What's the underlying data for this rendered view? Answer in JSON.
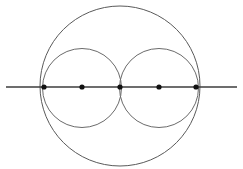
{
  "figure": {
    "canvas": {
      "width": 243,
      "height": 169,
      "background": "#ffffff"
    },
    "colors": {
      "circle_stroke": "#6b6b6b",
      "big_circle_stroke": "#5a5a5a",
      "line_stroke": "#3c3c3c",
      "point_fill": "#111111"
    },
    "stroke_widths": {
      "circle": 1,
      "line": 1.6
    },
    "shapes": {
      "big_circle": {
        "label": "large outer circle",
        "cx": 120,
        "cy": 86,
        "r": 80
      },
      "left_circle": {
        "label": "left inner circle",
        "cx": 82,
        "cy": 88,
        "r": 39.5
      },
      "right_circle": {
        "label": "right inner circle",
        "cx": 159,
        "cy": 88,
        "r": 39.5
      },
      "diameter_line": {
        "label": "horizontal diameter line",
        "x1": 6,
        "y1": 87,
        "x2": 237,
        "y2": 87
      }
    },
    "points": [
      {
        "name": "left-endpoint",
        "cx": 44,
        "cy": 87,
        "r": 2.6
      },
      {
        "name": "left-center",
        "cx": 82,
        "cy": 87,
        "r": 2.6
      },
      {
        "name": "tangency-midpoint",
        "cx": 120,
        "cy": 87,
        "r": 2.6
      },
      {
        "name": "right-center",
        "cx": 159,
        "cy": 87,
        "r": 2.6
      },
      {
        "name": "right-endpoint",
        "cx": 196,
        "cy": 87,
        "r": 2.6
      }
    ]
  },
  "chart_data": {
    "type": "scatter",
    "xlabel": "",
    "ylabel": "",
    "xlim": [
      0,
      243
    ],
    "ylim": [
      0,
      169
    ],
    "grid": false,
    "legend": "none",
    "annotations": [
      "Large circle of radius 80 centred at (120, 86)",
      "Two equal inner circles of radius 39.5 internally tangent to the large circle and tangent to each other",
      "A horizontal line through all three centres extends past the large circle on both sides"
    ],
    "series": [
      {
        "name": "marked points on the diameter",
        "x": [
          44,
          82,
          120,
          159,
          196
        ],
        "y": [
          87,
          87,
          87,
          87,
          87
        ]
      }
    ],
    "circles": [
      {
        "name": "big circle",
        "cx": 120,
        "cy": 86,
        "r": 80
      },
      {
        "name": "left circle",
        "cx": 82,
        "cy": 88,
        "r": 39.5
      },
      {
        "name": "right circle",
        "cx": 159,
        "cy": 88,
        "r": 39.5
      }
    ],
    "lines": [
      {
        "name": "diameter line",
        "x": [
          6,
          237
        ],
        "y": [
          87,
          87
        ]
      }
    ]
  }
}
